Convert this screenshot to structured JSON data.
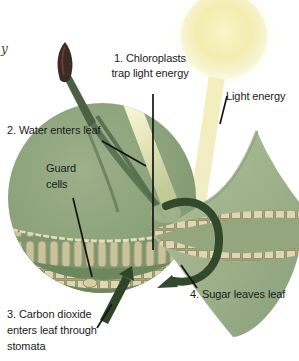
{
  "figure": {
    "marginalia_fragment": "y",
    "labels": {
      "chloroplasts": [
        "1. Chloroplasts",
        "trap light energy"
      ],
      "light_energy": "Light energy",
      "water": "2. Water enters leaf",
      "guard_cells": [
        "Guard",
        "cells"
      ],
      "carbon_dioxide": [
        "3. Carbon dioxide",
        "enters leaf through",
        "stomata"
      ],
      "sugar": "4. Sugar leaves leaf"
    },
    "colors": {
      "background": "#ffffff",
      "leaf_body_green": "#8aa17a",
      "leaf_blade_green": "#9db08a",
      "cell_tan": "#ddd8b2",
      "sun_yellow": "#f3edb0",
      "beam_yellow": "#f2edc0",
      "arrow_dark_green": "#32492c",
      "stem_bud_maroon": "#3b2b27",
      "pointer_line_black": "#141414",
      "text": "#1b1b1b"
    }
  }
}
